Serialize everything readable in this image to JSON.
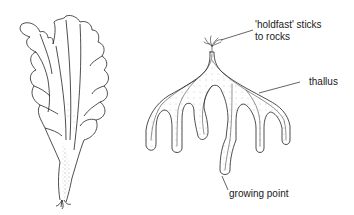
{
  "diagram": {
    "figures": [
      {
        "name": "sea-lettuce-seaweed",
        "position": "left"
      },
      {
        "name": "branched-seaweed",
        "position": "right"
      }
    ],
    "labels": {
      "holdfast_line1": "'holdfast' sticks",
      "holdfast_line2": "to rocks",
      "thallus": "thallus",
      "growing_point": "growing point"
    },
    "colors": {
      "ink": "#1a1a1a",
      "background": "#ffffff"
    }
  }
}
